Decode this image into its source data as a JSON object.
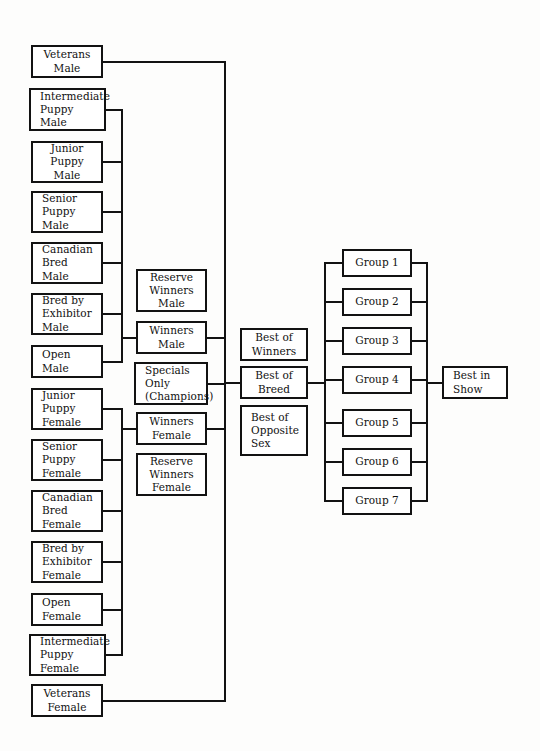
{
  "diagram": {
    "type": "flowchart",
    "line_color": "#121212",
    "box_fill": "#ffffff",
    "background": "#fdfdfc",
    "columns": [
      {
        "name": "classes",
        "nodes": [
          {
            "id": "vet-male",
            "lines": [
              "Veterans",
              "Male"
            ],
            "x": 31,
            "y": 45,
            "w": 72,
            "h": 33,
            "align": "center"
          },
          {
            "id": "int-puppy-male",
            "lines": [
              "Intermediate",
              "Puppy",
              "Male"
            ],
            "x": 29,
            "y": 88,
            "w": 77,
            "h": 43,
            "align": "left"
          },
          {
            "id": "jr-puppy-male",
            "lines": [
              "Junior",
              "Puppy",
              "Male"
            ],
            "x": 31,
            "y": 141,
            "w": 72,
            "h": 42,
            "align": "center"
          },
          {
            "id": "sr-puppy-male",
            "lines": [
              "Senior",
              "Puppy",
              "Male"
            ],
            "x": 31,
            "y": 191,
            "w": 72,
            "h": 42,
            "align": "left"
          },
          {
            "id": "can-bred-male",
            "lines": [
              "Canadian",
              "Bred",
              "Male"
            ],
            "x": 31,
            "y": 242,
            "w": 72,
            "h": 42,
            "align": "left"
          },
          {
            "id": "bred-exh-male",
            "lines": [
              "Bred by",
              "Exhibitor",
              "Male"
            ],
            "x": 31,
            "y": 293,
            "w": 72,
            "h": 42,
            "align": "left"
          },
          {
            "id": "open-male",
            "lines": [
              "Open",
              "Male"
            ],
            "x": 31,
            "y": 345,
            "w": 72,
            "h": 33,
            "align": "left"
          },
          {
            "id": "jr-puppy-fem",
            "lines": [
              "Junior",
              "Puppy",
              "Female"
            ],
            "x": 31,
            "y": 388,
            "w": 72,
            "h": 42,
            "align": "left"
          },
          {
            "id": "sr-puppy-fem",
            "lines": [
              "Senior",
              "Puppy",
              "Female"
            ],
            "x": 31,
            "y": 439,
            "w": 72,
            "h": 42,
            "align": "left"
          },
          {
            "id": "can-bred-fem",
            "lines": [
              "Canadian",
              "Bred",
              "Female"
            ],
            "x": 31,
            "y": 490,
            "w": 72,
            "h": 42,
            "align": "left"
          },
          {
            "id": "bred-exh-fem",
            "lines": [
              "Bred by",
              "Exhibitor",
              "Female"
            ],
            "x": 31,
            "y": 541,
            "w": 72,
            "h": 42,
            "align": "left"
          },
          {
            "id": "open-fem",
            "lines": [
              "Open",
              "Female"
            ],
            "x": 31,
            "y": 593,
            "w": 72,
            "h": 33,
            "align": "left"
          },
          {
            "id": "int-puppy-fem",
            "lines": [
              "Intermediate",
              "Puppy",
              "Female"
            ],
            "x": 29,
            "y": 634,
            "w": 77,
            "h": 42,
            "align": "left"
          },
          {
            "id": "vet-fem",
            "lines": [
              "Veterans",
              "Female"
            ],
            "x": 31,
            "y": 684,
            "w": 72,
            "h": 33,
            "align": "center"
          }
        ]
      },
      {
        "name": "winners",
        "nodes": [
          {
            "id": "res-win-male",
            "lines": [
              "Reserve",
              "Winners",
              "Male"
            ],
            "x": 136,
            "y": 269,
            "w": 71,
            "h": 43,
            "align": "center"
          },
          {
            "id": "win-male",
            "lines": [
              "Winners",
              "Male"
            ],
            "x": 136,
            "y": 321,
            "w": 71,
            "h": 33,
            "align": "center"
          },
          {
            "id": "specials",
            "lines": [
              "Specials",
              "Only",
              "(Champions)"
            ],
            "x": 134,
            "y": 362,
            "w": 74,
            "h": 43,
            "align": "left"
          },
          {
            "id": "win-fem",
            "lines": [
              "Winners",
              "Female"
            ],
            "x": 136,
            "y": 412,
            "w": 71,
            "h": 33,
            "align": "center"
          },
          {
            "id": "res-win-fem",
            "lines": [
              "Reserve",
              "Winners",
              "Female"
            ],
            "x": 136,
            "y": 453,
            "w": 71,
            "h": 43,
            "align": "center"
          }
        ]
      },
      {
        "name": "breed",
        "nodes": [
          {
            "id": "best-of-winners",
            "lines": [
              "Best of",
              "Winners"
            ],
            "x": 240,
            "y": 328,
            "w": 68,
            "h": 33,
            "align": "center"
          },
          {
            "id": "best-of-breed",
            "lines": [
              "Best of",
              "Breed"
            ],
            "x": 240,
            "y": 366,
            "w": 68,
            "h": 33,
            "align": "center"
          },
          {
            "id": "best-opp-sex",
            "lines": [
              "Best of",
              "Opposite",
              "Sex"
            ],
            "x": 240,
            "y": 405,
            "w": 68,
            "h": 51,
            "align": "left"
          }
        ]
      },
      {
        "name": "groups",
        "nodes": [
          {
            "id": "group-1",
            "lines": [
              "Group 1"
            ],
            "x": 342,
            "y": 249,
            "w": 70,
            "h": 28,
            "align": "center"
          },
          {
            "id": "group-2",
            "lines": [
              "Group 2"
            ],
            "x": 342,
            "y": 288,
            "w": 70,
            "h": 28,
            "align": "center"
          },
          {
            "id": "group-3",
            "lines": [
              "Group 3"
            ],
            "x": 342,
            "y": 327,
            "w": 70,
            "h": 28,
            "align": "center"
          },
          {
            "id": "group-4",
            "lines": [
              "Group 4"
            ],
            "x": 342,
            "y": 366,
            "w": 70,
            "h": 28,
            "align": "center"
          },
          {
            "id": "group-5",
            "lines": [
              "Group 5"
            ],
            "x": 342,
            "y": 409,
            "w": 70,
            "h": 28,
            "align": "center"
          },
          {
            "id": "group-6",
            "lines": [
              "Group 6"
            ],
            "x": 342,
            "y": 448,
            "w": 70,
            "h": 28,
            "align": "center"
          },
          {
            "id": "group-7",
            "lines": [
              "Group 7"
            ],
            "x": 342,
            "y": 487,
            "w": 70,
            "h": 28,
            "align": "center"
          }
        ]
      },
      {
        "name": "final",
        "nodes": [
          {
            "id": "best-in-show",
            "lines": [
              "Best in",
              "Show"
            ],
            "x": 442,
            "y": 366,
            "w": 66,
            "h": 33,
            "align": "left"
          }
        ]
      }
    ]
  }
}
